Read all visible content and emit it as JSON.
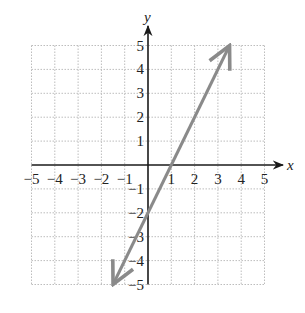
{
  "chart_data": {
    "type": "line",
    "title": "",
    "xlabel": "x",
    "ylabel": "y",
    "xlim": [
      -5,
      5
    ],
    "ylim": [
      -5,
      5
    ],
    "grid": true,
    "grid_style": "dotted",
    "x_tick_labels": [
      "−5",
      "−4",
      "−3",
      "−2",
      "−1",
      "1",
      "2",
      "3",
      "4",
      "5"
    ],
    "x_ticks": [
      -5,
      -4,
      -3,
      -2,
      -1,
      1,
      2,
      3,
      4,
      5
    ],
    "y_tick_labels": [
      "5",
      "4",
      "3",
      "2",
      "1",
      "−1",
      "−2",
      "−3",
      "−4",
      "−5"
    ],
    "y_ticks": [
      5,
      4,
      3,
      2,
      1,
      -1,
      -2,
      -3,
      -4,
      -5
    ],
    "series": [
      {
        "name": "y = 2x − 2",
        "equation": "y = 2x - 2",
        "slope": 2,
        "intercept": -2,
        "x": [
          -1.5,
          0,
          1,
          3.5
        ],
        "y": [
          -5,
          -2,
          0,
          5
        ],
        "arrows_both_ends": true,
        "color": "#8a8a8a"
      }
    ],
    "colors": {
      "axis": "#1a1a1a",
      "grid": "#bdbdbd",
      "line": "#8a8a8a"
    }
  }
}
